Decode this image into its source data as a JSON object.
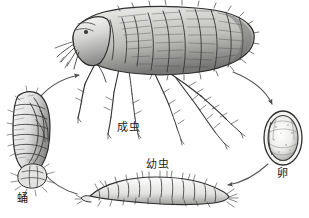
{
  "figure": {
    "background_color": "#ffffff",
    "ink_color": "#2b2b2b",
    "style": "pen-and-ink scientific illustration, grayscale"
  },
  "labels": {
    "adult": "成虫",
    "larva": "幼虫",
    "egg": "卵",
    "pupa": "蛹"
  },
  "stages": [
    {
      "key": "adult",
      "label": "成虫",
      "position": "top-center",
      "description": "Adult flea, laterally compressed body, segmented abdomen, long spiny hind legs"
    },
    {
      "key": "egg",
      "label": "卵",
      "position": "right",
      "description": "Oval egg with dark rim and pale speckled interior"
    },
    {
      "key": "larva",
      "label": "幼虫",
      "position": "bottom-center",
      "description": "Elongated segmented larva with bristles"
    },
    {
      "key": "pupa",
      "label": "蛹",
      "position": "left",
      "description": "Vertical segmented pupa within cocoon debris"
    }
  ],
  "arrows": [
    {
      "from": "pupa",
      "to": "adult",
      "direction": "up-right"
    },
    {
      "from": "adult",
      "to": "egg",
      "direction": "down-right"
    },
    {
      "from": "egg",
      "to": "larva",
      "direction": "down-left"
    },
    {
      "from": "larva",
      "to": "pupa",
      "direction": "up-left"
    }
  ]
}
